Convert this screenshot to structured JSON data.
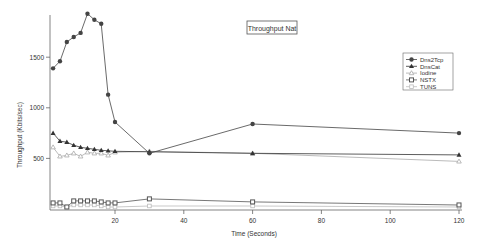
{
  "chart_data": {
    "type": "line",
    "title": "Throughput Nat",
    "xlabel": "Time (Seconds)",
    "ylabel": "Throughput (Kbits/sec)",
    "xlim": [
      0,
      120
    ],
    "ylim": [
      0,
      1920
    ],
    "xticks": [
      20,
      40,
      60,
      80,
      100,
      120
    ],
    "yticks": [
      500,
      1000,
      1500
    ],
    "grid": false,
    "legend_position": "upper-right",
    "x": [
      2,
      4,
      6,
      8,
      10,
      12,
      14,
      16,
      18,
      20,
      30,
      60,
      120
    ],
    "series": [
      {
        "name": "Dns2Tcp",
        "marker": "circle",
        "color": "#444444",
        "values": [
          1390,
          1460,
          1650,
          1700,
          1740,
          1930,
          1870,
          1830,
          1130,
          860,
          550,
          840,
          750
        ]
      },
      {
        "name": "DnsCat",
        "marker": "triangle",
        "color": "#333333",
        "values": [
          750,
          670,
          660,
          630,
          610,
          600,
          590,
          580,
          575,
          570,
          565,
          550,
          535
        ]
      },
      {
        "name": "Iodine",
        "marker": "triangle-open",
        "color": "#aaaaaa",
        "values": [
          610,
          520,
          530,
          550,
          520,
          560,
          550,
          550,
          530,
          560,
          570,
          550,
          470
        ]
      },
      {
        "name": "NSTX",
        "marker": "square",
        "color": "#555555",
        "values": [
          60,
          60,
          20,
          80,
          80,
          80,
          80,
          70,
          60,
          60,
          100,
          70,
          40
        ]
      },
      {
        "name": "TUNS",
        "marker": "square-open",
        "color": "#bbbbbb",
        "values": [
          30,
          30,
          20,
          40,
          40,
          40,
          40,
          30,
          20,
          20,
          30,
          30,
          20
        ]
      }
    ]
  }
}
